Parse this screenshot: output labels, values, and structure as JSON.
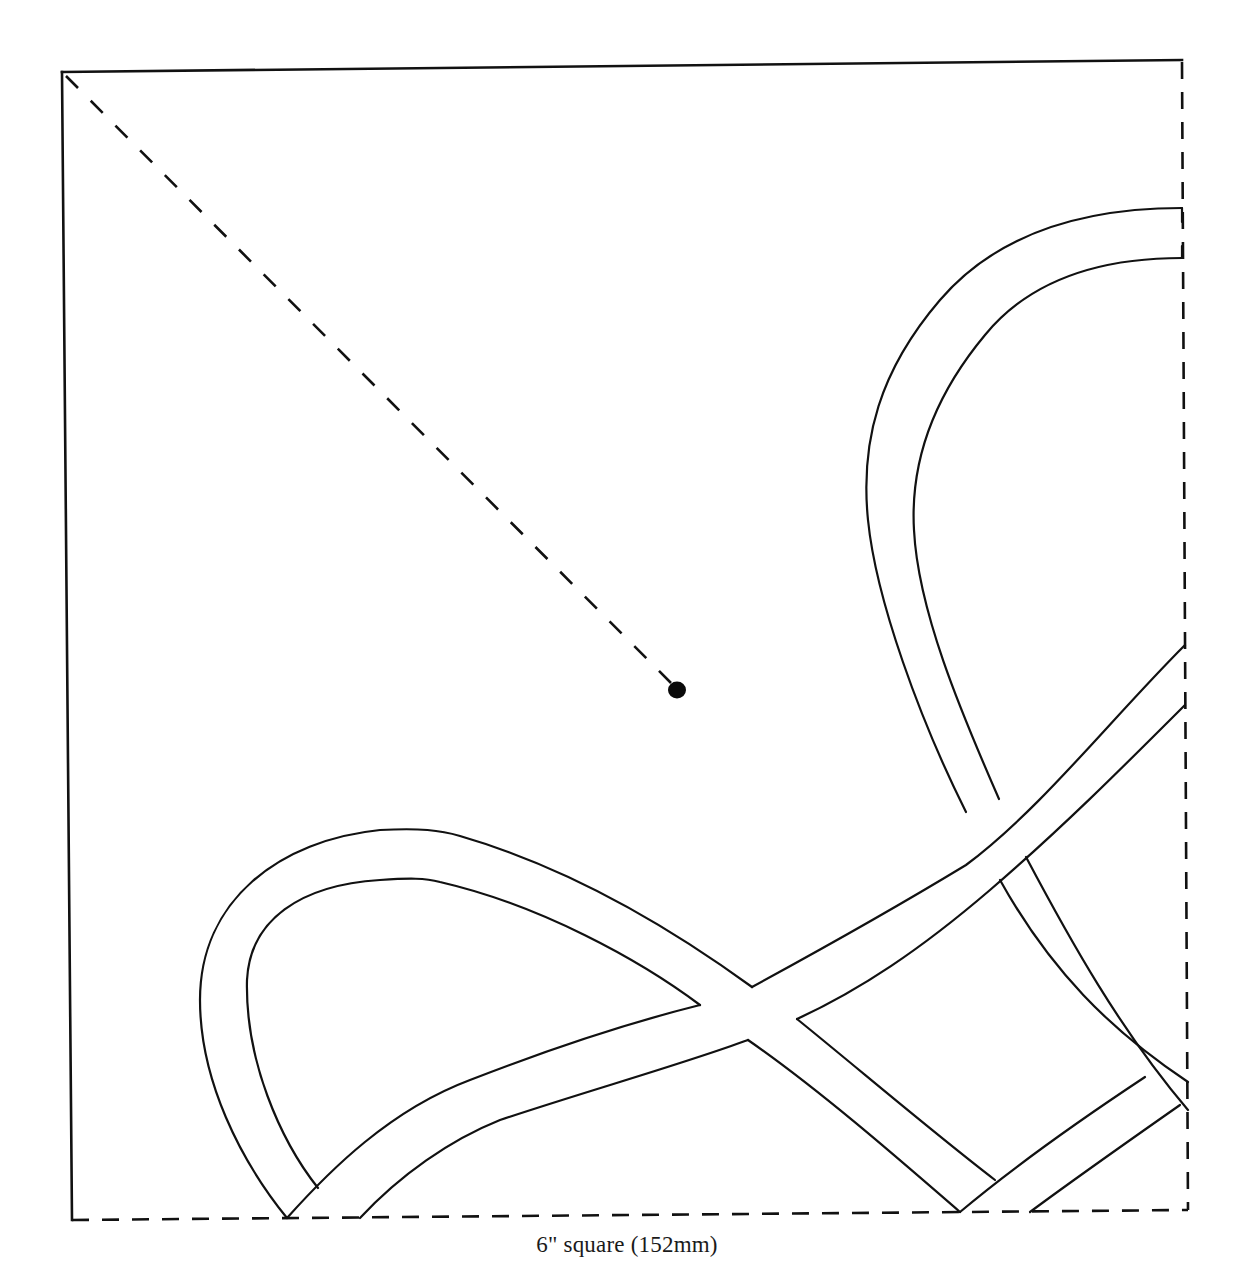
{
  "figure": {
    "type": "quilt applique block template",
    "caption": "6\" square (152mm)",
    "block_size_label": "6\" square (152mm)",
    "colors": {
      "line": "#111111",
      "background": "#ffffff",
      "dot": "#0a0a0a"
    },
    "elements": {
      "outer_square": {
        "solid_edges": [
          "top",
          "left"
        ],
        "dashed_edges": [
          "right",
          "bottom"
        ]
      },
      "diagonal_guide": {
        "style": "dashed",
        "from": "top-left corner",
        "to": "center dot"
      },
      "center_marker": "filled dot",
      "bands": [
        "left loop band",
        "rising diagonal band",
        "large right loop band",
        "lower-right rising band"
      ]
    }
  }
}
